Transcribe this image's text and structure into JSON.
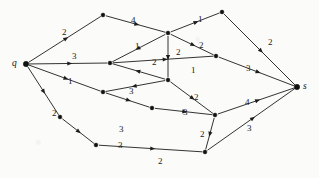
{
  "figure": {
    "type": "weighted-directed-graph",
    "source_label": "q",
    "sink_label": "s",
    "node_count": 14,
    "edge_count": 21
  },
  "nodes": [
    {
      "id": "q",
      "label": "q",
      "x": 26,
      "y": 64,
      "terminal": true
    },
    {
      "id": "a",
      "label": "",
      "x": 103,
      "y": 15,
      "terminal": false
    },
    {
      "id": "b",
      "label": "",
      "x": 168,
      "y": 33,
      "terminal": false
    },
    {
      "id": "c",
      "label": "",
      "x": 222,
      "y": 12,
      "terminal": false
    },
    {
      "id": "d",
      "label": "",
      "x": 110,
      "y": 63,
      "terminal": false
    },
    {
      "id": "e",
      "label": "",
      "x": 168,
      "y": 80,
      "terminal": false
    },
    {
      "id": "f",
      "label": "",
      "x": 216,
      "y": 56,
      "terminal": false
    },
    {
      "id": "g",
      "label": "",
      "x": 103,
      "y": 92,
      "terminal": false
    },
    {
      "id": "h",
      "label": "",
      "x": 152,
      "y": 108,
      "terminal": false
    },
    {
      "id": "i",
      "label": "",
      "x": 215,
      "y": 115,
      "terminal": false
    },
    {
      "id": "j",
      "label": "",
      "x": 96,
      "y": 145,
      "terminal": false
    },
    {
      "id": "k",
      "label": "",
      "x": 205,
      "y": 152,
      "terminal": false
    },
    {
      "id": "m",
      "label": "",
      "x": 60,
      "y": 117,
      "terminal": false
    },
    {
      "id": "s",
      "label": "s",
      "x": 297,
      "y": 87,
      "terminal": true
    }
  ],
  "edges": [
    {
      "from": "q",
      "to": "a",
      "weight": "2",
      "lx": 62,
      "ly": 28
    },
    {
      "from": "q",
      "to": "d",
      "weight": "3",
      "lx": 72,
      "ly": 52
    },
    {
      "from": "q",
      "to": "g",
      "weight": "1",
      "lx": 68,
      "ly": 77
    },
    {
      "from": "q",
      "to": "m",
      "weight": "2",
      "lx": 52,
      "ly": 109
    },
    {
      "from": "a",
      "to": "b",
      "weight": "4",
      "lx": 131,
      "ly": 16
    },
    {
      "from": "b",
      "to": "c",
      "weight": "1",
      "lx": 198,
      "ly": 15
    },
    {
      "from": "c",
      "to": "s",
      "weight": "2",
      "lx": 268,
      "ly": 38
    },
    {
      "from": "b",
      "to": "d",
      "weight": "1",
      "lx": 135,
      "ly": 42
    },
    {
      "from": "b",
      "to": "e",
      "weight": "2",
      "lx": 176,
      "ly": 48
    },
    {
      "from": "b",
      "to": "f",
      "weight": "2",
      "lx": 199,
      "ly": 41
    },
    {
      "from": "d",
      "to": "f",
      "weight": "1",
      "lx": 191,
      "ly": 66
    },
    {
      "from": "f",
      "to": "s",
      "weight": "3",
      "lx": 246,
      "ly": 64
    },
    {
      "from": "e",
      "to": "d",
      "weight": "2",
      "lx": 152,
      "ly": 58
    },
    {
      "from": "e",
      "to": "g",
      "weight": "3",
      "lx": 129,
      "ly": 87
    },
    {
      "from": "e",
      "to": "i",
      "weight": "2",
      "lx": 194,
      "ly": 93
    },
    {
      "from": "g",
      "to": "h",
      "weight": "3",
      "lx": 119,
      "ly": 125
    },
    {
      "from": "h",
      "to": "i",
      "weight": "3",
      "lx": 183,
      "ly": 108
    },
    {
      "from": "i",
      "to": "s",
      "weight": "4",
      "lx": 245,
      "ly": 98
    },
    {
      "from": "i",
      "to": "k",
      "weight": "2",
      "lx": 200,
      "ly": 130
    },
    {
      "from": "k",
      "to": "s",
      "weight": "3",
      "lx": 247,
      "ly": 124
    },
    {
      "from": "m",
      "to": "j",
      "weight": "3",
      "lx": 118,
      "ly": 141
    },
    {
      "from": "j",
      "to": "k",
      "weight": "2",
      "lx": 158,
      "ly": 157
    }
  ],
  "colors": {
    "ink": "#1c1c1c",
    "paper": "#fbfbf9"
  }
}
